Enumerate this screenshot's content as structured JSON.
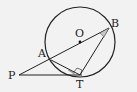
{
  "diagram": {
    "type": "geometry",
    "points": {
      "O": {
        "label": "O",
        "x": 80,
        "y": 42
      },
      "A": {
        "label": "A",
        "x": 51,
        "y": 58
      },
      "B": {
        "label": "B",
        "x": 109,
        "y": 28
      },
      "P": {
        "label": "P",
        "x": 19,
        "y": 75
      },
      "T": {
        "label": "T",
        "x": 78,
        "y": 74
      }
    },
    "circle": {
      "center": "O",
      "radius": 35
    },
    "segments": [
      "PB",
      "PT",
      "BT",
      "AT"
    ],
    "markers": [
      "right-angle-at-T",
      "angle-arc-at-B",
      "angle-arc-at-T"
    ],
    "colors": {
      "stroke": "#222222",
      "background": "#f2f2f2",
      "marker_fill": "#c8c8c8"
    }
  }
}
